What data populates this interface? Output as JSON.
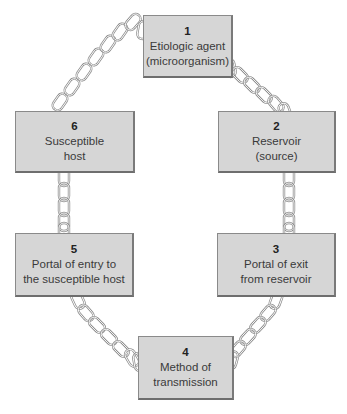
{
  "diagram": {
    "type": "chain-of-infection",
    "nodes": [
      {
        "id": 1,
        "number": "1",
        "lines": [
          "Etiologic agent",
          "(microorganism)"
        ]
      },
      {
        "id": 2,
        "number": "2",
        "lines": [
          "Reservoir",
          "(source)"
        ]
      },
      {
        "id": 3,
        "number": "3",
        "lines": [
          "Portal of exit",
          "from reservoir"
        ]
      },
      {
        "id": 4,
        "number": "4",
        "lines": [
          "Method of",
          "transmission"
        ]
      },
      {
        "id": 5,
        "number": "5",
        "lines": [
          "Portal of entry to",
          "the susceptible host"
        ]
      },
      {
        "id": 6,
        "number": "6",
        "lines": [
          "Susceptible",
          "host"
        ]
      }
    ],
    "links": [
      {
        "from": 1,
        "to": 2
      },
      {
        "from": 2,
        "to": 3
      },
      {
        "from": 3,
        "to": 4
      },
      {
        "from": 4,
        "to": 5
      },
      {
        "from": 5,
        "to": 6
      },
      {
        "from": 6,
        "to": 1
      }
    ],
    "colors": {
      "box_fill": "#d6d6d6",
      "box_border": "#8a8a8a",
      "chain_stroke": "#8c8c8c",
      "text": "#3a3a3a"
    }
  }
}
